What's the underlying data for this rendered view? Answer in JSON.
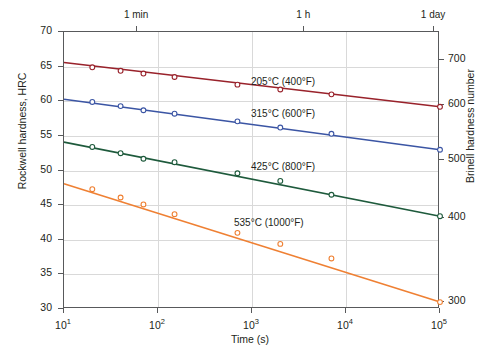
{
  "chart_data": {
    "type": "line",
    "title": "",
    "xlabel": "Time (s)",
    "ylabel": "Rockwell hardness, HRC",
    "ylabel_secondary": "Brinell hardness number",
    "xscale": "log",
    "xlim": [
      10,
      100000
    ],
    "ylim": [
      30,
      70
    ],
    "ylim_secondary": [
      250,
      730
    ],
    "grid": true,
    "legend": "inline-labels",
    "x_ticks": [
      {
        "value": 10,
        "label": "10",
        "exp": "1"
      },
      {
        "value": 100,
        "label": "10",
        "exp": "2"
      },
      {
        "value": 1000,
        "label": "10",
        "exp": "3"
      },
      {
        "value": 10000,
        "label": "10",
        "exp": "4"
      },
      {
        "value": 100000,
        "label": "10",
        "exp": "5"
      }
    ],
    "y_ticks_left": [
      30,
      35,
      40,
      45,
      50,
      55,
      60,
      65,
      70
    ],
    "y_ticks_right": [
      {
        "label": "300",
        "hrc": 31.0
      },
      {
        "label": "400",
        "hrc": 43.1
      },
      {
        "label": "500",
        "hrc": 51.5
      },
      {
        "label": "600",
        "hrc": 59.5
      },
      {
        "label": "700",
        "hrc": 66.0
      }
    ],
    "top_axis_ticks": [
      {
        "label": "1 min",
        "value": 60
      },
      {
        "label": "1 h",
        "value": 3600
      },
      {
        "label": "1 day",
        "value": 86400
      }
    ],
    "series": [
      {
        "name": "205°C (400°F)",
        "label": "205°C (400°F)",
        "color": "#99222b",
        "marker": "circle",
        "label_x": 250,
        "label_y": 75,
        "fit": [
          {
            "x": 10,
            "y": 65.6
          },
          {
            "x": 100000,
            "y": 59.2
          }
        ],
        "points": [
          {
            "x": 20,
            "y": 64.9
          },
          {
            "x": 40,
            "y": 64.4
          },
          {
            "x": 70,
            "y": 64.0
          },
          {
            "x": 150,
            "y": 63.5
          },
          {
            "x": 700,
            "y": 62.4
          },
          {
            "x": 2000,
            "y": 61.7
          },
          {
            "x": 7000,
            "y": 61.0
          },
          {
            "x": 100000,
            "y": 59.2
          }
        ]
      },
      {
        "name": "315°C (600°F)",
        "label": "315°C (600°F)",
        "color": "#3b55a4",
        "marker": "circle",
        "label_x": 250,
        "label_y": 107,
        "fit": [
          {
            "x": 10,
            "y": 60.3
          },
          {
            "x": 100000,
            "y": 53.0
          }
        ],
        "points": [
          {
            "x": 20,
            "y": 59.9
          },
          {
            "x": 40,
            "y": 59.3
          },
          {
            "x": 70,
            "y": 58.7
          },
          {
            "x": 150,
            "y": 58.2
          },
          {
            "x": 700,
            "y": 57.1
          },
          {
            "x": 2000,
            "y": 56.2
          },
          {
            "x": 7000,
            "y": 55.3
          },
          {
            "x": 100000,
            "y": 53.0
          }
        ]
      },
      {
        "name": "425°C (800°F)",
        "label": "425°C (800°F)",
        "color": "#1e5a3c",
        "marker": "circle",
        "label_x": 250,
        "label_y": 160,
        "fit": [
          {
            "x": 10,
            "y": 54.1
          },
          {
            "x": 100000,
            "y": 43.4
          }
        ],
        "points": [
          {
            "x": 20,
            "y": 53.4
          },
          {
            "x": 40,
            "y": 52.5
          },
          {
            "x": 70,
            "y": 51.7
          },
          {
            "x": 150,
            "y": 51.2
          },
          {
            "x": 700,
            "y": 49.6
          },
          {
            "x": 2000,
            "y": 48.5
          },
          {
            "x": 7000,
            "y": 46.5
          },
          {
            "x": 100000,
            "y": 43.4
          }
        ]
      },
      {
        "name": "535°C (1000°F)",
        "label": "535°C (1000°F)",
        "color": "#ef8033",
        "marker": "circle",
        "label_x": 233,
        "label_y": 216,
        "fit": [
          {
            "x": 10,
            "y": 48.1
          },
          {
            "x": 100000,
            "y": 31.0
          }
        ],
        "points": [
          {
            "x": 20,
            "y": 47.3
          },
          {
            "x": 40,
            "y": 46.1
          },
          {
            "x": 70,
            "y": 45.1
          },
          {
            "x": 150,
            "y": 43.7
          },
          {
            "x": 700,
            "y": 41.0
          },
          {
            "x": 2000,
            "y": 39.4
          },
          {
            "x": 7000,
            "y": 37.3
          },
          {
            "x": 100000,
            "y": 31.0
          }
        ]
      }
    ]
  }
}
